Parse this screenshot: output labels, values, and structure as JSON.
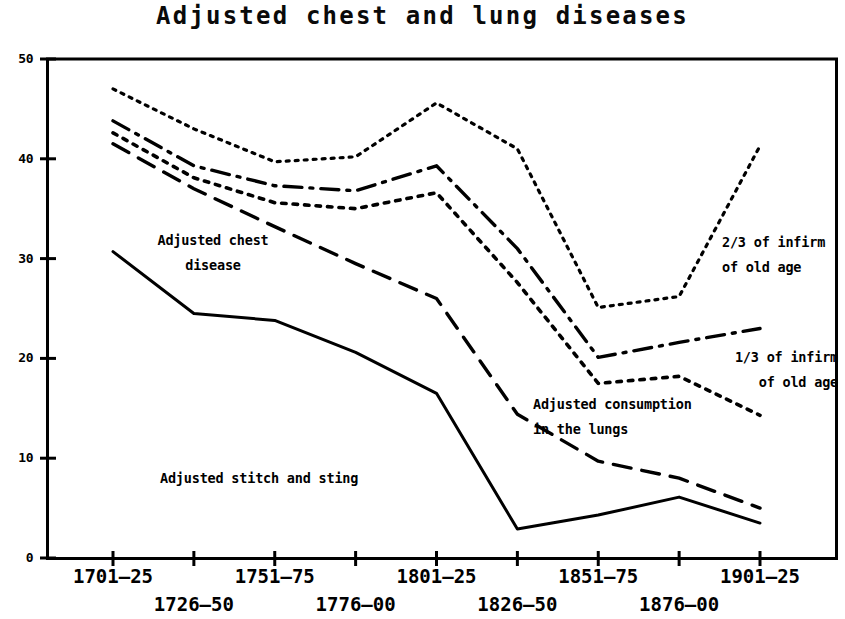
{
  "chart_data": {
    "type": "line",
    "title": "Adjusted chest and lung diseases",
    "xlabel": "",
    "ylabel": "",
    "ylim": [
      0,
      50
    ],
    "yticks": [
      0,
      10,
      20,
      30,
      40,
      50
    ],
    "grid": false,
    "legend": "inline-annotations",
    "categories": [
      "1701–25",
      "1726–50",
      "1751–75",
      "1776–00",
      "1801–25",
      "1826–50",
      "1851–75",
      "1876–00",
      "1901–25"
    ],
    "series": [
      {
        "name": "2/3 of infirm of old age",
        "style": "fine-dotted",
        "values": [
          47.0,
          43.0,
          39.7,
          40.2,
          45.6,
          41.0,
          25.1,
          26.2,
          41.3
        ]
      },
      {
        "name": "1/3 of infirm of old age",
        "style": "dash-dot",
        "values": [
          43.8,
          39.3,
          37.3,
          36.8,
          39.3,
          31.0,
          20.1,
          21.6,
          23.0
        ]
      },
      {
        "name": "Adjusted consumption in the lungs",
        "style": "coarse-dotted",
        "values": [
          42.6,
          38.1,
          35.6,
          35.0,
          36.6,
          27.6,
          17.5,
          18.2,
          14.3
        ]
      },
      {
        "name": "Adjusted chest disease",
        "style": "long-dashed",
        "values": [
          41.5,
          37.0,
          33.2,
          29.5,
          26.0,
          14.4,
          9.7,
          8.0,
          5.0
        ]
      },
      {
        "name": "Adjusted stitch and sting",
        "style": "solid",
        "values": [
          30.7,
          24.5,
          23.8,
          20.6,
          16.5,
          2.9,
          4.3,
          6.1,
          3.5
        ]
      }
    ],
    "annotations": [
      {
        "text": "Adjusted chest\ndisease",
        "align": "center",
        "x": 213,
        "y": 228
      },
      {
        "text": "2/3 of infirm\nof old age",
        "align": "left",
        "x": 722,
        "y": 230
      },
      {
        "text": "1/3 of infirm\nof old age",
        "align": "right",
        "x": 838,
        "y": 345
      },
      {
        "text": "Adjusted consumption\nin the lungs",
        "align": "left",
        "x": 533,
        "y": 392
      },
      {
        "text": "Adjusted stitch and sting",
        "align": "left",
        "x": 160,
        "y": 466
      }
    ]
  }
}
